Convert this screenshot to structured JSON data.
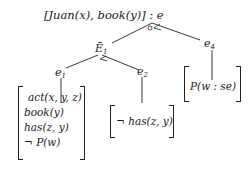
{
  "diagram": {
    "type": "tree",
    "root": {
      "label": "[Juan(x), book(y)] : e",
      "junction_marks": [
        "circle",
        "<"
      ]
    },
    "nodes": {
      "E1": {
        "label_main": "Ē",
        "label_sub": "1",
        "junction_marks": [
          "<"
        ]
      },
      "e4": {
        "label_main": "e",
        "label_sub": "4"
      },
      "e1": {
        "label_main": "e",
        "label_sub": "1"
      },
      "e2": {
        "label_main": "e",
        "label_sub": "2"
      }
    },
    "boxes": {
      "e1": {
        "lines": [
          "act(x, y, z)",
          "book(y)",
          "has(z, y)",
          "¬ P(w)"
        ]
      },
      "e2": {
        "lines": [
          "¬ has(z, y)"
        ]
      },
      "e4": {
        "lines": [
          "P(w : se)"
        ]
      }
    },
    "edges": [
      [
        "root",
        "E1"
      ],
      [
        "root",
        "e4"
      ],
      [
        "E1",
        "e1"
      ],
      [
        "E1",
        "e2"
      ],
      [
        "e1",
        "box-e1"
      ],
      [
        "e2",
        "box-e2"
      ],
      [
        "e4",
        "box-e4"
      ]
    ]
  }
}
